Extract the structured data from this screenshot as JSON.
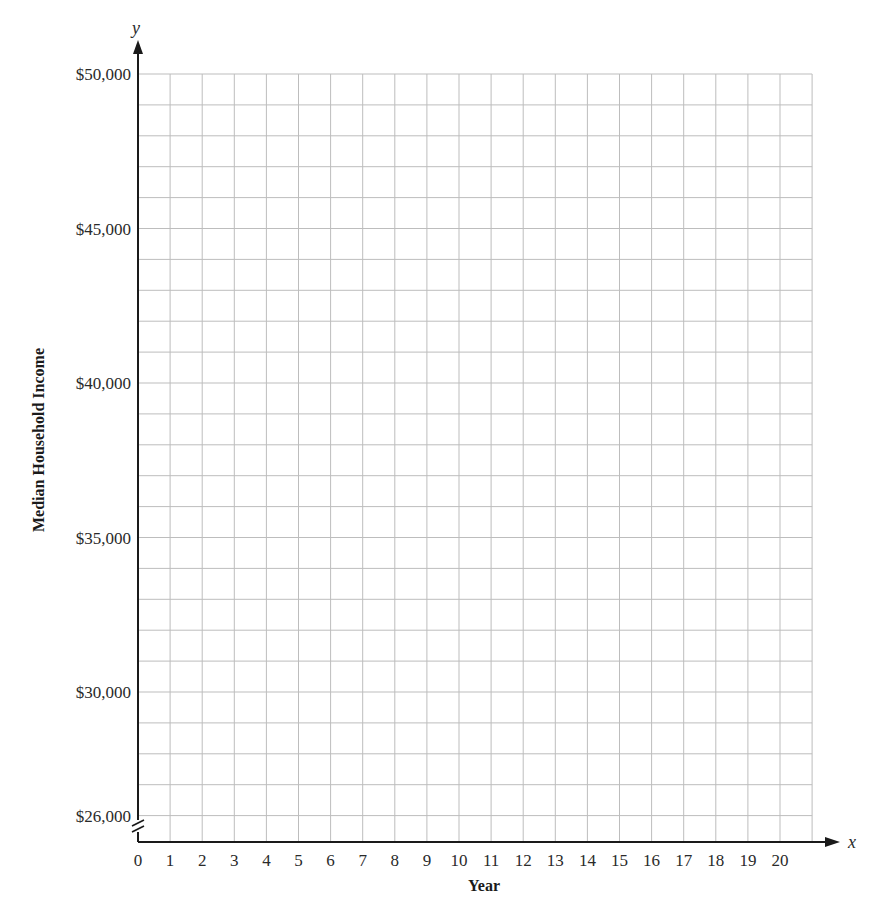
{
  "chart_data": {
    "type": "line",
    "title": "",
    "xlabel": "Year",
    "ylabel": "Median Household Income",
    "x_axis_letter": "x",
    "y_axis_letter": "y",
    "x_ticks": [
      0,
      1,
      2,
      3,
      4,
      5,
      6,
      7,
      8,
      9,
      10,
      11,
      12,
      13,
      14,
      15,
      16,
      17,
      18,
      19,
      20
    ],
    "x_tick_labels": [
      "0",
      "1",
      "2",
      "3",
      "4",
      "5",
      "6",
      "7",
      "8",
      "9",
      "10",
      "11",
      "12",
      "13",
      "14",
      "15",
      "16",
      "17",
      "18",
      "19",
      "20"
    ],
    "xlim": [
      0,
      21
    ],
    "y_ticks": [
      26000,
      30000,
      35000,
      40000,
      45000,
      50000
    ],
    "y_tick_labels": [
      "$26,000",
      "$30,000",
      "$35,000",
      "$40,000",
      "$45,000",
      "$50,000"
    ],
    "ylim": [
      25000,
      50000
    ],
    "y_axis_break": true,
    "grid": true,
    "grid_step_x": 1,
    "grid_step_y": 1000,
    "series": [],
    "colors": {
      "grid": "#bdbdbd",
      "axis": "#1a1a1a"
    }
  }
}
